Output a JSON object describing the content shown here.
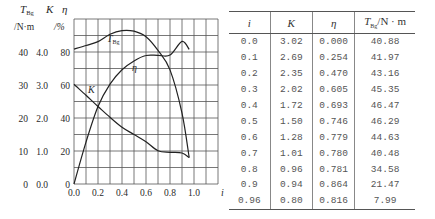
{
  "chart_data": {
    "type": "line",
    "title": "",
    "xlabel": "i",
    "ylabel_left": [
      "T_Bg /N·m",
      "K",
      "η /%"
    ],
    "axis_headers": {
      "t_label": "T",
      "t_sub": "Bg",
      "k_label": "K",
      "eta_label": "η",
      "t_unit": "/N·m",
      "eta_unit": "/%"
    },
    "x_ticks": [
      "0.0",
      "0.2",
      "0.4",
      "0.6",
      "0.8",
      "1.0"
    ],
    "x_axis_label": "i",
    "y_ticks": [
      {
        "t": "0",
        "k": "0.0",
        "eta": "0"
      },
      {
        "t": "10",
        "k": "1.0",
        "eta": "20"
      },
      {
        "t": "20",
        "k": "2.0",
        "eta": "40"
      },
      {
        "t": "30",
        "k": "3.0",
        "eta": "60"
      },
      {
        "t": "40",
        "k": "4.0",
        "eta": "80"
      }
    ],
    "xlim": [
      0,
      1.2
    ],
    "ylim_T": [
      0,
      50
    ],
    "ylim_K": [
      0,
      5.0
    ],
    "ylim_eta": [
      0,
      100
    ],
    "grid": true,
    "curve_labels": {
      "T": "T",
      "T_sub": "Bg",
      "K": "K",
      "eta": "η"
    },
    "x": [
      0.0,
      0.1,
      0.2,
      0.3,
      0.4,
      0.5,
      0.6,
      0.7,
      0.8,
      0.9,
      0.96
    ],
    "series": [
      {
        "name": "T_Bg (N·m)",
        "values": [
          40.88,
          41.97,
          43.16,
          45.35,
          46.47,
          46.29,
          44.63,
          40.48,
          34.58,
          21.47,
          7.99
        ]
      },
      {
        "name": "K",
        "values": [
          3.02,
          2.69,
          2.35,
          2.02,
          1.72,
          1.5,
          1.28,
          1.01,
          0.96,
          0.94,
          0.8
        ]
      },
      {
        "name": "η (%)",
        "values": [
          0.0,
          25.4,
          47.0,
          60.5,
          69.3,
          74.6,
          77.9,
          78.0,
          78.1,
          86.4,
          81.6
        ]
      }
    ]
  },
  "table": {
    "headers": {
      "i": "i",
      "k": "K",
      "eta": "η",
      "t": "T",
      "t_sub": "Bg",
      "t_unit": "/N · m"
    },
    "rows": [
      [
        "0.0",
        "3.02",
        "0.000",
        "40.88"
      ],
      [
        "0.1",
        "2.69",
        "0.254",
        "41.97"
      ],
      [
        "0.2",
        "2.35",
        "0.470",
        "43.16"
      ],
      [
        "0.3",
        "2.02",
        "0.605",
        "45.35"
      ],
      [
        "0.4",
        "1.72",
        "0.693",
        "46.47"
      ],
      [
        "0.5",
        "1.50",
        "0.746",
        "46.29"
      ],
      [
        "0.6",
        "1.28",
        "0.779",
        "44.63"
      ],
      [
        "0.7",
        "1.01",
        "0.780",
        "40.48"
      ],
      [
        "0.8",
        "0.96",
        "0.781",
        "34.58"
      ],
      [
        "0.9",
        "0.94",
        "0.864",
        "21.47"
      ],
      [
        "0.96",
        "0.80",
        "0.816",
        "7.99"
      ]
    ]
  }
}
